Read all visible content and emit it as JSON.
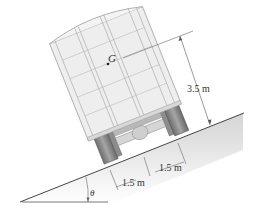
{
  "figure": {
    "labels": {
      "center_of_gravity": "G",
      "height": "3.5 m",
      "half_width_right": "1.5 m",
      "half_width_left": "1.5 m",
      "angle": "θ"
    },
    "colors": {
      "body_fill": "#eeeeee",
      "body_stroke": "#9a9a9a",
      "chassis": "#7d7d7d",
      "ground": "#dddddd",
      "line": "#444444"
    }
  }
}
